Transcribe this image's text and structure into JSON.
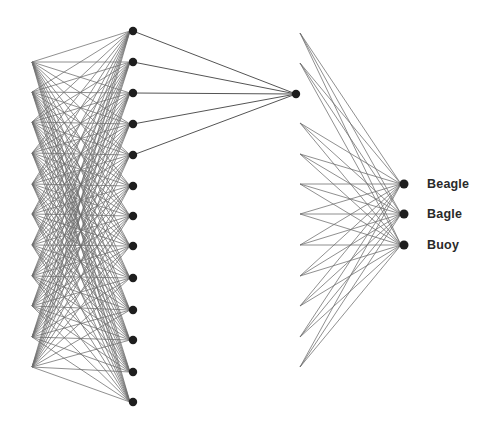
{
  "diagram": {
    "type": "neural-network",
    "left_points": {
      "x": 32,
      "y": [
        62,
        92,
        122,
        153,
        184,
        214,
        245,
        276,
        306,
        337,
        367
      ]
    },
    "hidden_column": {
      "x": 133,
      "y": [
        31,
        62,
        93,
        124,
        155,
        186,
        216,
        246,
        278,
        310,
        340,
        372,
        402
      ]
    },
    "hidden_to_hub_indices": [
      0,
      1,
      2,
      3,
      4
    ],
    "hub_node": {
      "x": 296,
      "y": 94
    },
    "fan_sources": {
      "x": 300,
      "y": [
        33,
        63,
        123,
        154,
        184,
        214,
        245,
        276,
        306,
        337,
        367
      ]
    },
    "output_nodes": {
      "x": 404,
      "y": [
        184,
        214,
        245
      ]
    },
    "colors": {
      "edge": "#6e6e6e",
      "node": "#1e1e1e",
      "label": "#2a2a2a"
    }
  },
  "labels": {
    "outputs": [
      "Beagle",
      "Bagle",
      "Buoy"
    ]
  }
}
